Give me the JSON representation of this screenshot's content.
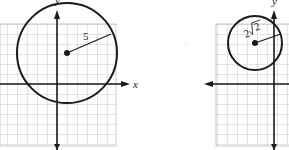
{
  "figures": [
    {
      "id": "left",
      "x_axis_label": "x",
      "y_axis_label": "y",
      "circle_center": [
        1,
        3
      ],
      "radius_label": "5",
      "radius": 5
    },
    {
      "id": "right",
      "x_axis_label": "x",
      "y_axis_label": "y",
      "circle_center": [
        -2,
        4
      ],
      "radius_label": "2√2",
      "radius_coefficient": "2",
      "radius_radicand": "2"
    }
  ],
  "colors": {
    "grid": "#bdbdbd",
    "ink": "#1a1a1a"
  }
}
